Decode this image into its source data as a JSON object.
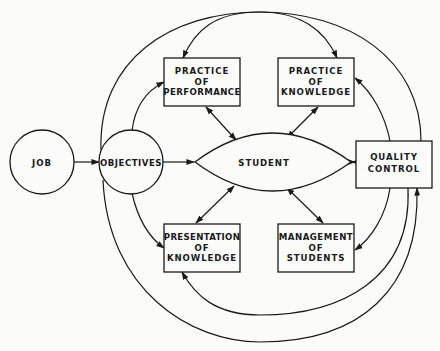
{
  "diagram": {
    "type": "flow-diagram",
    "colors": {
      "ink": "#1a1a1a",
      "paper": "#fbfbfa"
    },
    "nodes": {
      "job": {
        "shape": "circle",
        "label": [
          "JOB"
        ]
      },
      "objectives": {
        "shape": "circle",
        "label": [
          "OBJECTIVES"
        ]
      },
      "student": {
        "shape": "lens",
        "label": [
          "STUDENT"
        ]
      },
      "quality_control": {
        "shape": "box",
        "label": [
          "QUALITY",
          "CONTROL"
        ]
      },
      "practice_performance": {
        "shape": "box",
        "label": [
          "PRACTICE",
          "OF",
          "PERFORMANCE"
        ]
      },
      "practice_knowledge": {
        "shape": "box",
        "label": [
          "PRACTICE",
          "OF",
          "KNOWLEDGE"
        ]
      },
      "presentation_knowledge": {
        "shape": "box",
        "label": [
          "PRESENTATION",
          "OF",
          "KNOWLEDGE"
        ]
      },
      "management_students": {
        "shape": "box",
        "label": [
          "MANAGEMENT",
          "OF",
          "STUDENTS"
        ]
      }
    },
    "edges": [
      {
        "from": "job",
        "to": "objectives",
        "direction": "forward"
      },
      {
        "from": "objectives",
        "to": "student",
        "direction": "forward"
      },
      {
        "from": "objectives",
        "to": "practice_performance",
        "direction": "forward"
      },
      {
        "from": "objectives",
        "to": "presentation_knowledge",
        "direction": "forward"
      },
      {
        "from": "objectives",
        "to": "practice_knowledge",
        "direction": "forward",
        "style": "outer-arc-top"
      },
      {
        "from": "objectives",
        "to": "quality_control",
        "direction": "forward",
        "style": "outer-arc-bottom"
      },
      {
        "from": "quality_control",
        "to": "practice_performance",
        "direction": "forward",
        "style": "outer-arc-top"
      },
      {
        "from": "quality_control",
        "to": "practice_knowledge",
        "direction": "forward"
      },
      {
        "from": "quality_control",
        "to": "management_students",
        "direction": "forward"
      },
      {
        "from": "quality_control",
        "to": "presentation_knowledge",
        "direction": "forward",
        "style": "outer-arc-bottom"
      },
      {
        "from": "student",
        "to": "quality_control",
        "direction": "both"
      },
      {
        "from": "student",
        "to": "practice_performance",
        "direction": "both"
      },
      {
        "from": "student",
        "to": "practice_knowledge",
        "direction": "both"
      },
      {
        "from": "student",
        "to": "presentation_knowledge",
        "direction": "both"
      },
      {
        "from": "student",
        "to": "management_students",
        "direction": "both"
      }
    ]
  }
}
